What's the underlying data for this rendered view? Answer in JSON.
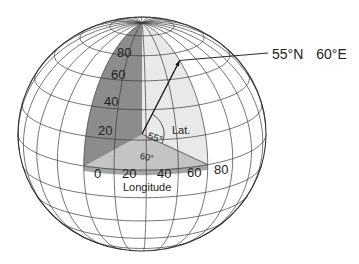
{
  "title_label": {
    "lat": "55°N",
    "lon": "60°E"
  },
  "globe": {
    "center": [
      142,
      134
    ],
    "radius_x": 124,
    "radius_y": 117,
    "tilt_deg": 18,
    "view_lon_deg": 28,
    "meridian_step_deg": 15,
    "parallel_step_deg": 15,
    "line_color": "#3a3a3a"
  },
  "wedges": {
    "meridian_plane_color": "#8c8c8c",
    "lat_plane_color": "#e9e9e9",
    "equator_plane_color": "#c4c4c4",
    "equator_rim_color": "#a5a5a5"
  },
  "latitude_ticks": [
    "20",
    "40",
    "60",
    "80"
  ],
  "longitude_ticks": [
    "0",
    "20",
    "40",
    "60",
    "80"
  ],
  "longitude_axis_label": "Longitude",
  "lat_plane_label": "Lat.",
  "angle_labels": {
    "latitude": "55°",
    "longitude": "60°"
  },
  "point": {
    "lat": 55,
    "lon": 60
  }
}
